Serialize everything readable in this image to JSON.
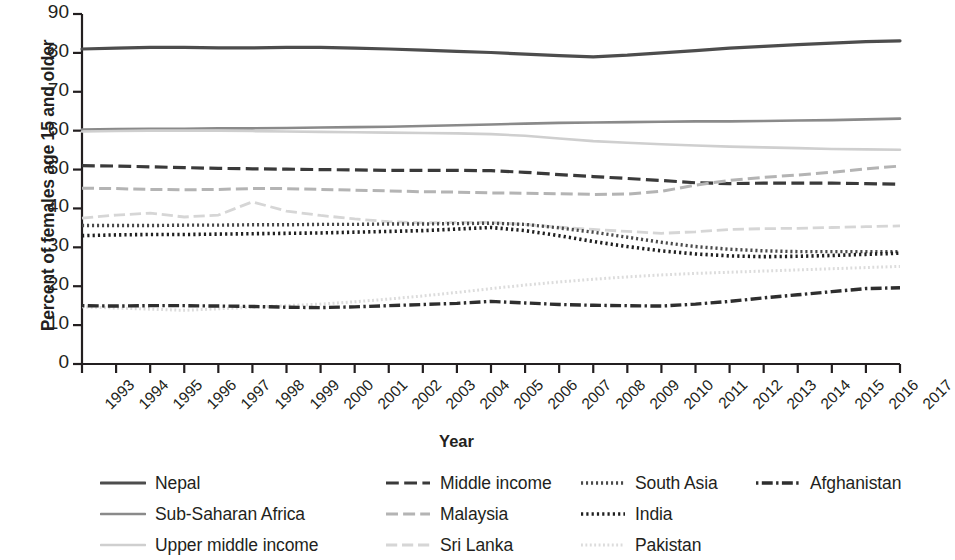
{
  "chart_data": {
    "type": "line",
    "title": "",
    "xlabel": "Year",
    "ylabel": "Percent of females age 15 and older",
    "xlim": [
      1993,
      2017
    ],
    "ylim": [
      0,
      90
    ],
    "ytick_step": 10,
    "grid": false,
    "legend_position": "bottom",
    "yticks": [
      "90",
      "80",
      "70",
      "60",
      "50",
      "40",
      "30",
      "20",
      "10",
      "0"
    ],
    "categories": [
      "1993",
      "1994",
      "1995",
      "1996",
      "1997",
      "1998",
      "1999",
      "2000",
      "2001",
      "2002",
      "2003",
      "2004",
      "2005",
      "2006",
      "2007",
      "2008",
      "2009",
      "2010",
      "2011",
      "2012",
      "2013",
      "2014",
      "2015",
      "2016",
      "2017"
    ],
    "series": [
      {
        "name": "Nepal",
        "color": "#4d4d4d",
        "style": "solid",
        "width": 3.2,
        "values": [
          81.0,
          81.2,
          81.4,
          81.4,
          81.3,
          81.3,
          81.4,
          81.4,
          81.2,
          81.0,
          80.7,
          80.4,
          80.1,
          79.7,
          79.3,
          79.0,
          79.4,
          80.0,
          80.6,
          81.2,
          81.7,
          82.1,
          82.5,
          82.9,
          83.1
        ]
      },
      {
        "name": "Sub-Saharan Africa",
        "color": "#8a8a8a",
        "style": "solid",
        "width": 2.6,
        "values": [
          60.3,
          60.4,
          60.5,
          60.5,
          60.6,
          60.6,
          60.7,
          60.8,
          60.9,
          61.0,
          61.2,
          61.4,
          61.6,
          61.8,
          62.0,
          62.1,
          62.2,
          62.3,
          62.4,
          62.4,
          62.5,
          62.6,
          62.7,
          62.9,
          63.1
        ]
      },
      {
        "name": "Upper middle income",
        "color": "#cfcfcf",
        "style": "solid",
        "width": 2.6,
        "values": [
          59.8,
          59.9,
          60.0,
          60.0,
          60.0,
          59.9,
          59.8,
          59.7,
          59.6,
          59.5,
          59.4,
          59.3,
          59.1,
          58.7,
          58.0,
          57.3,
          56.9,
          56.5,
          56.2,
          55.9,
          55.7,
          55.5,
          55.3,
          55.2,
          55.1
        ]
      },
      {
        "name": "Middle income",
        "color": "#3a3a3a",
        "style": "dashed",
        "width": 3.2,
        "values": [
          51.0,
          50.9,
          50.7,
          50.5,
          50.3,
          50.2,
          50.1,
          50.0,
          49.9,
          49.8,
          49.8,
          49.8,
          49.7,
          49.3,
          48.7,
          48.2,
          47.7,
          47.2,
          46.6,
          46.4,
          46.5,
          46.5,
          46.5,
          46.4,
          46.2
        ]
      },
      {
        "name": "Malaysia",
        "color": "#b4b4b4",
        "style": "dashed",
        "width": 3.0,
        "values": [
          45.2,
          45.1,
          44.9,
          44.8,
          44.9,
          45.1,
          45.1,
          44.9,
          44.7,
          44.5,
          44.3,
          44.2,
          44.0,
          43.9,
          43.8,
          43.6,
          43.7,
          44.4,
          46.0,
          47.2,
          48.0,
          48.6,
          49.3,
          50.2,
          50.9
        ]
      },
      {
        "name": "Sri Lanka",
        "color": "#d6d6d6",
        "style": "dashed",
        "width": 2.8,
        "values": [
          37.5,
          38.3,
          38.8,
          37.8,
          38.3,
          41.7,
          39.3,
          38.2,
          37.3,
          36.6,
          36.3,
          36.4,
          36.4,
          35.9,
          35.2,
          34.6,
          34.1,
          33.6,
          34.0,
          34.6,
          34.8,
          34.9,
          35.1,
          35.3,
          35.5
        ]
      },
      {
        "name": "South Asia",
        "color": "#4a4a4a",
        "style": "dotted",
        "width": 3.4,
        "values": [
          35.6,
          35.6,
          35.6,
          35.7,
          35.7,
          35.8,
          35.8,
          35.9,
          35.9,
          36.0,
          36.0,
          36.1,
          36.2,
          35.9,
          35.0,
          33.9,
          32.6,
          31.3,
          30.2,
          29.5,
          29.1,
          28.9,
          28.9,
          28.9,
          28.9
        ]
      },
      {
        "name": "India",
        "color": "#1f1f1f",
        "style": "dotted",
        "width": 3.6,
        "values": [
          33.0,
          33.2,
          33.3,
          33.3,
          33.4,
          33.5,
          33.6,
          33.7,
          33.9,
          34.1,
          34.3,
          34.7,
          35.1,
          34.3,
          33.0,
          31.5,
          30.2,
          29.1,
          28.3,
          27.8,
          27.6,
          27.7,
          27.9,
          28.2,
          28.5
        ]
      },
      {
        "name": "Pakistan",
        "color": "#dcdcdc",
        "style": "dotted",
        "width": 3.0,
        "values": [
          14.7,
          14.4,
          14.1,
          13.8,
          14.2,
          14.6,
          15.0,
          15.4,
          16.0,
          16.7,
          17.5,
          18.4,
          19.4,
          20.3,
          21.1,
          21.8,
          22.4,
          22.9,
          23.3,
          23.6,
          23.9,
          24.2,
          24.5,
          24.8,
          25.1
        ]
      },
      {
        "name": "Afghanistan",
        "color": "#2e2e2e",
        "style": "dashdot",
        "width": 3.4,
        "values": [
          15.0,
          14.9,
          15.0,
          15.0,
          14.9,
          14.8,
          14.6,
          14.5,
          14.7,
          15.0,
          15.3,
          15.6,
          16.1,
          15.7,
          15.3,
          15.1,
          15.0,
          14.9,
          15.4,
          16.1,
          17.0,
          17.8,
          18.6,
          19.4,
          19.6
        ]
      }
    ]
  },
  "legend": {
    "columns": [
      [
        {
          "label": "Nepal",
          "series": "Nepal"
        },
        {
          "label": "Sub-Saharan Africa",
          "series": "Sub-Saharan Africa"
        },
        {
          "label": "Upper middle income",
          "series": "Upper middle income"
        }
      ],
      [
        {
          "label": "Middle income",
          "series": "Middle income"
        },
        {
          "label": "Malaysia",
          "series": "Malaysia"
        },
        {
          "label": "Sri Lanka",
          "series": "Sri Lanka"
        }
      ],
      [
        {
          "label": "South Asia",
          "series": "South Asia"
        },
        {
          "label": "India",
          "series": "India"
        },
        {
          "label": "Pakistan",
          "series": "Pakistan"
        }
      ],
      [
        {
          "label": "Afghanistan",
          "series": "Afghanistan"
        }
      ]
    ]
  },
  "axes": {
    "y_title": "Percent of females age 15 and older",
    "x_title": "Year",
    "axis_color": "#231f20"
  }
}
